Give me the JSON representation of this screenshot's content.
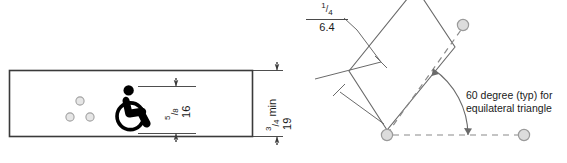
{
  "drawing": {
    "title": "ADA raised character and braille sign mounting detail",
    "background_color": "#ffffff",
    "line_color": "#4a4a4a",
    "panel_border_color": "#3a3a3a",
    "symbol_color": "#000000",
    "dot_fill_color": "#e3e3e3",
    "dot_stroke_color": "#9a9a9a"
  },
  "left_view": {
    "name": "sign-panel-elevation",
    "panel": {
      "label": "sign-panel"
    },
    "symbol": {
      "name": "international-symbol-of-accessibility",
      "label": "wheelchair symbol"
    },
    "braille_dots": {
      "count": 3,
      "label": "braille dots"
    },
    "dimensions": [
      {
        "name": "symbol-height",
        "fraction_numerator": "5",
        "fraction_denominator": "8",
        "imperial": "5/8",
        "metric": "16",
        "orientation": "vertical",
        "units_note": "inches over millimeters"
      },
      {
        "name": "panel-height-min",
        "fraction_numerator": "3",
        "fraction_denominator": "4",
        "imperial": "3/4",
        "qualifier": "min",
        "imperial_label": "3/4 min",
        "metric": "19",
        "orientation": "vertical",
        "units_note": "inches over millimeters"
      }
    ]
  },
  "right_view": {
    "name": "braille-cell-geometry-detail",
    "leader_dimension": {
      "name": "dot-spacing",
      "fraction_numerator": "1",
      "fraction_denominator": "4",
      "imperial": "1/4",
      "metric": "6.4",
      "units_note": "inches over millimeters"
    },
    "annotation": {
      "name": "angle-note",
      "line1": "60 degree (typ) for",
      "line2": "equilateral triangle",
      "angle_value": "60"
    },
    "dots": {
      "count": 3,
      "label": "braille dot centers"
    },
    "rotated_rectangle": {
      "label": "rotated dimension box",
      "rotation_deg": "25"
    }
  }
}
